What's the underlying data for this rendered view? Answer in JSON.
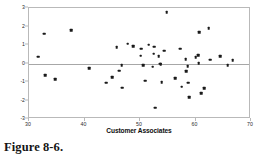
{
  "figure": {
    "caption": "Figure 8-6."
  },
  "chart_data": {
    "type": "scatter",
    "title": "",
    "xlabel": "Customer Associates",
    "ylabel": "Standardized Residual",
    "xlim": [
      30,
      70
    ],
    "ylim": [
      -3,
      3
    ],
    "xticks": [
      30,
      40,
      50,
      60,
      70
    ],
    "yticks": [
      3,
      2,
      1,
      0,
      -1,
      -2,
      -3
    ],
    "xtick_labels": [
      "30",
      "40",
      "50",
      "60",
      "70"
    ],
    "ytick_labels": [
      "3",
      "2",
      "1",
      "0",
      "-1",
      "-2",
      "-3"
    ],
    "grid": false,
    "legend": false,
    "reference_line_y": 0,
    "marker": "filled-square",
    "marker_color": "#1a1a1a",
    "frame_color": "#b9b9b9",
    "points": [
      {
        "x": 31.7,
        "y": 0.36
      },
      {
        "x": 32.7,
        "y": 1.6
      },
      {
        "x": 32.9,
        "y": -0.62
      },
      {
        "x": 34.7,
        "y": -0.85
      },
      {
        "x": 37.6,
        "y": 1.79
      },
      {
        "x": 40.9,
        "y": -0.24
      },
      {
        "x": 43.9,
        "y": -1.03
      },
      {
        "x": 45.0,
        "y": -0.74
      },
      {
        "x": 45.8,
        "y": 0.88
      },
      {
        "x": 46.3,
        "y": -0.39
      },
      {
        "x": 46.7,
        "y": -0.08
      },
      {
        "x": 46.8,
        "y": -1.31
      },
      {
        "x": 47.8,
        "y": 1.06
      },
      {
        "x": 48.8,
        "y": 0.92
      },
      {
        "x": 50.1,
        "y": 0.42
      },
      {
        "x": 50.2,
        "y": 0.79
      },
      {
        "x": 50.6,
        "y": -0.1
      },
      {
        "x": 50.9,
        "y": -0.92
      },
      {
        "x": 51.6,
        "y": 1.01
      },
      {
        "x": 52.3,
        "y": -0.18
      },
      {
        "x": 52.5,
        "y": 0.52
      },
      {
        "x": 52.6,
        "y": 0.91
      },
      {
        "x": 52.7,
        "y": -2.38
      },
      {
        "x": 53.4,
        "y": 0.38
      },
      {
        "x": 53.6,
        "y": -0.01
      },
      {
        "x": 53.7,
        "y": -0.03
      },
      {
        "x": 53.9,
        "y": -1.0
      },
      {
        "x": 54.4,
        "y": 0.7
      },
      {
        "x": 54.8,
        "y": 2.76
      },
      {
        "x": 56.3,
        "y": -0.79
      },
      {
        "x": 57.2,
        "y": 0.79
      },
      {
        "x": 57.5,
        "y": -1.26
      },
      {
        "x": 58.2,
        "y": 0.22
      },
      {
        "x": 58.3,
        "y": -0.43
      },
      {
        "x": 58.6,
        "y": -0.14
      },
      {
        "x": 58.7,
        "y": -1.03
      },
      {
        "x": 58.9,
        "y": -1.82
      },
      {
        "x": 60.0,
        "y": 0.33
      },
      {
        "x": 60.5,
        "y": 0.44
      },
      {
        "x": 60.6,
        "y": 0.03
      },
      {
        "x": 60.7,
        "y": 1.7
      },
      {
        "x": 61.0,
        "y": -1.62
      },
      {
        "x": 61.6,
        "y": -1.32
      },
      {
        "x": 62.4,
        "y": 1.92
      },
      {
        "x": 62.6,
        "y": 0.21
      },
      {
        "x": 64.4,
        "y": 0.39
      },
      {
        "x": 65.8,
        "y": -0.08
      },
      {
        "x": 66.7,
        "y": 0.18
      }
    ]
  }
}
